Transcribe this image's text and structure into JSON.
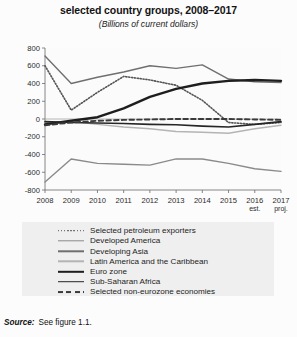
{
  "header": {
    "title": "selected country groups, 2008–2017",
    "subtitle": "(Billions of current dollars)"
  },
  "source": {
    "label": "Source:",
    "text": "See figure 1.1."
  },
  "axis": {
    "y_ticks": [
      "800",
      "600",
      "400",
      "200",
      "0",
      "-200",
      "-400",
      "-600",
      "-800"
    ],
    "x_ticks": [
      "2008",
      "2009",
      "2010",
      "2011",
      "2012",
      "2013",
      "2014",
      "2015",
      "2016",
      "2017"
    ],
    "x_annotations": [
      {
        "year": "2016",
        "note": "est."
      },
      {
        "year": "2017",
        "note": "proj."
      }
    ]
  },
  "legend": {
    "items": [
      {
        "label": "Selected petroleum exporters",
        "style": "dotted",
        "color": "#555555",
        "width": 1.6
      },
      {
        "label": "Developed America",
        "style": "solid",
        "color": "#8a8a8a",
        "width": 1.4
      },
      {
        "label": "Developing Asia",
        "style": "solid",
        "color": "#6f6f6f",
        "width": 1.4
      },
      {
        "label": "Latin America and the Caribbean",
        "style": "solid",
        "color": "#b4b4b4",
        "width": 1.4
      },
      {
        "label": "Euro zone",
        "style": "solid",
        "color": "#1e1e1e",
        "width": 2.4
      },
      {
        "label": "Sub-Saharan Africa",
        "style": "solid",
        "color": "#262626",
        "width": 1.6
      },
      {
        "label": "Selected non-eurozone economies",
        "style": "dashed",
        "color": "#3a3a3a",
        "width": 1.9
      }
    ]
  },
  "chart_data": {
    "type": "line",
    "title": "selected country groups, 2008–2017",
    "subtitle": "(Billions of current dollars)",
    "xlabel": "",
    "ylabel": "Billions of current dollars",
    "x": [
      2008,
      2009,
      2010,
      2011,
      2012,
      2013,
      2014,
      2015,
      2016,
      2017
    ],
    "xtick_labels": [
      "2008",
      "2009",
      "2010",
      "2011",
      "2012",
      "2013",
      "2014",
      "2015",
      "2016",
      "2017"
    ],
    "ylim": [
      -800,
      800
    ],
    "ytick_values": [
      800,
      600,
      400,
      200,
      0,
      -200,
      -400,
      -600,
      -800
    ],
    "grid": false,
    "legend_position": "below",
    "series": [
      {
        "name": "Selected petroleum exporters",
        "style": "dotted",
        "color": "#555555",
        "values": [
          600,
          100,
          300,
          480,
          440,
          380,
          210,
          -40,
          -60,
          -40
        ]
      },
      {
        "name": "Developed America",
        "style": "solid",
        "color": "#8a8a8a",
        "values": [
          -710,
          -450,
          -500,
          -510,
          -520,
          -450,
          -450,
          -500,
          -560,
          -590
        ]
      },
      {
        "name": "Developing Asia",
        "style": "solid",
        "color": "#6f6f6f",
        "values": [
          710,
          400,
          470,
          530,
          600,
          570,
          610,
          450,
          420,
          410
        ]
      },
      {
        "name": "Latin America and the Caribbean",
        "style": "solid",
        "color": "#b4b4b4",
        "values": [
          -40,
          -30,
          -60,
          -90,
          -110,
          -140,
          -150,
          -160,
          -110,
          -70
        ]
      },
      {
        "name": "Euro zone",
        "style": "solid",
        "color": "#1e1e1e",
        "values": [
          -60,
          -20,
          20,
          120,
          250,
          340,
          400,
          430,
          440,
          430
        ]
      },
      {
        "name": "Sub-Saharan Africa",
        "style": "solid",
        "color": "#262626",
        "values": [
          -30,
          -40,
          -45,
          -50,
          -60,
          -65,
          -80,
          -90,
          -60,
          -30
        ]
      },
      {
        "name": "Selected non-eurozone economies",
        "style": "dashed",
        "color": "#3a3a3a",
        "values": [
          -70,
          -40,
          -20,
          -10,
          -5,
          0,
          0,
          0,
          -5,
          -10
        ]
      }
    ]
  }
}
